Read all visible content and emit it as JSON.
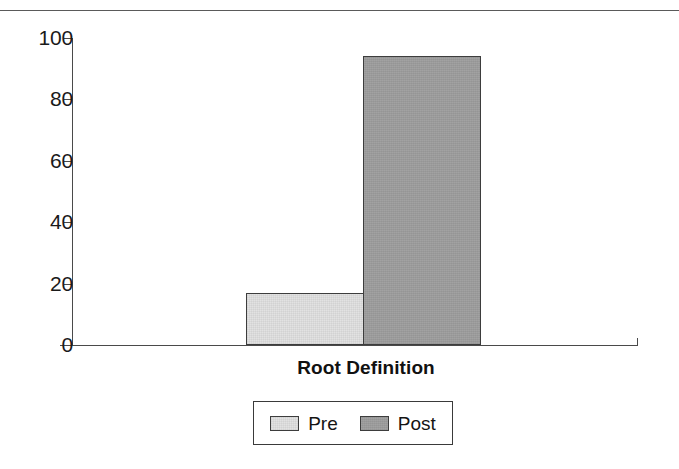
{
  "chart_data": {
    "type": "bar",
    "title": "",
    "subtitle": "",
    "categories": [
      "Root Definition"
    ],
    "series": [
      {
        "name": "Pre",
        "values": [
          17
        ]
      },
      {
        "name": "Post",
        "values": [
          94
        ]
      }
    ],
    "xlabel": "Root Definition",
    "ylabel": "",
    "ylim": [
      0,
      100
    ],
    "y_ticks": [
      {
        "value": 100,
        "label": "100"
      },
      {
        "value": 80,
        "label": "80"
      },
      {
        "value": 60,
        "label": "60"
      },
      {
        "value": 40,
        "label": "40"
      },
      {
        "value": 20,
        "label": "20"
      },
      {
        "value": 0,
        "label": "0"
      }
    ],
    "grid": false,
    "legend_position": "bottom",
    "legend": [
      {
        "label": "Pre",
        "color": "#e2e2e2"
      },
      {
        "label": "Post",
        "color": "#9d9d9d"
      }
    ],
    "colors": {
      "pre": "#e2e2e2",
      "post": "#9d9d9d",
      "axis": "#4a4a4a",
      "text": "#1a1a1a",
      "background": "#ffffff"
    }
  }
}
